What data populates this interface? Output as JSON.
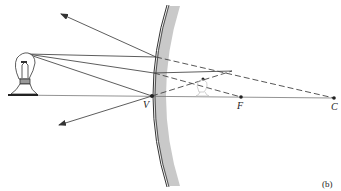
{
  "diagram": {
    "type": "ray-diagram",
    "panel_label": "(b)",
    "points": {
      "vertex": {
        "label": "V"
      },
      "focal_point": {
        "label": "F"
      },
      "center_of_curvature": {
        "label": "C"
      }
    },
    "elements": [
      {
        "name": "object",
        "description": "light bulb (real object) on principal axis"
      },
      {
        "name": "mirror",
        "description": "convex mirror, reflecting surface on left, shaded back"
      },
      {
        "name": "image",
        "description": "virtual, upright, reduced image of bulb behind mirror between V and F"
      },
      {
        "name": "principal-axis",
        "description": "horizontal line through V, F, C"
      }
    ],
    "rays": [
      {
        "name": "ray-toward-C",
        "incident": "solid",
        "reflected": "solid arrow up-left",
        "extension": "dashed toward C"
      },
      {
        "name": "ray-parallel",
        "incident": "solid",
        "reflected": "solid",
        "extension": "dashed from F"
      },
      {
        "name": "ray-to-vertex",
        "incident": "solid",
        "reflected": "solid arrow down-left",
        "extension": "dashed behind mirror"
      }
    ],
    "colors": {
      "line": "#333333",
      "mirror_shade": "#c8c8c8",
      "image": "#bbbbbb"
    }
  }
}
